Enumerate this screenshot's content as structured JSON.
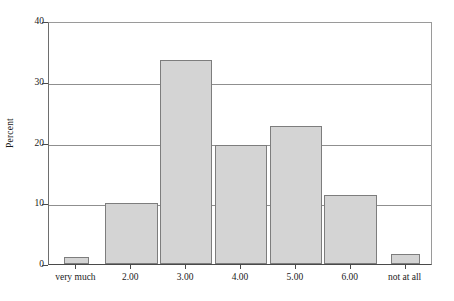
{
  "chart_data": {
    "type": "bar",
    "title": "",
    "subtitle": "",
    "xlabel": "",
    "ylabel": "Percent",
    "categories": [
      "very much",
      "2.00",
      "3.00",
      "4.00",
      "5.00",
      "6.00",
      "not at all"
    ],
    "values": [
      1.1,
      10.0,
      33.6,
      19.6,
      22.7,
      11.4,
      1.7
    ],
    "ylim": [
      0,
      40
    ],
    "yticks": [
      0,
      10,
      20,
      30,
      40
    ],
    "ytick_labels": [
      "0",
      "10",
      "20",
      "30",
      "40"
    ],
    "grid": "horizontal",
    "legend": "none",
    "bar_fill_color": "#d4d4d4",
    "bar_border_color": "#7d7d7d",
    "axis_color": "#4a4a4a",
    "gridline_color": "#8f8f8f",
    "background_color": "#ffffff",
    "bar_widths_relative": [
      0.46,
      0.96,
      0.96,
      0.96,
      0.96,
      0.96,
      0.54
    ]
  }
}
